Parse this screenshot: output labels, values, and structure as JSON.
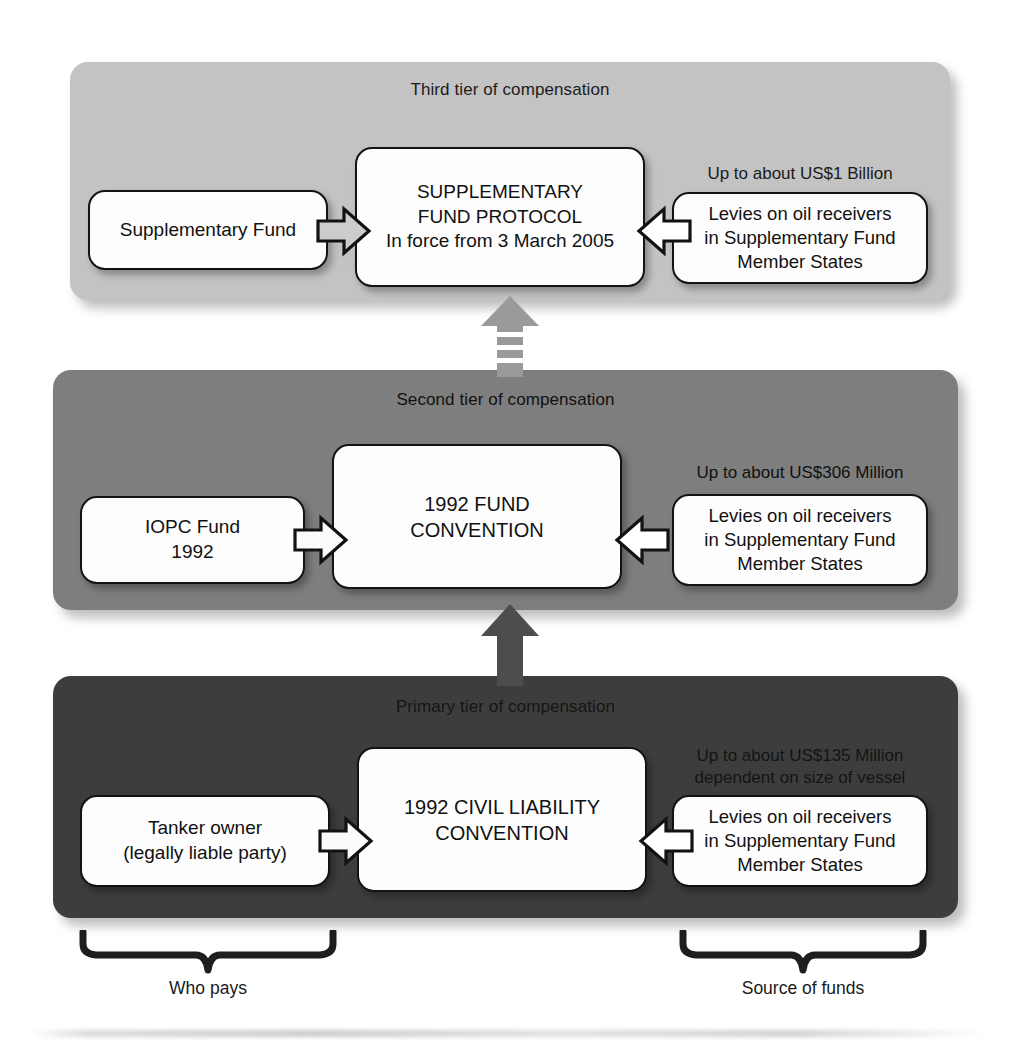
{
  "diagram": {
    "tiers": [
      {
        "id": "third",
        "title": "Third tier of compensation",
        "left_box": {
          "lines": [
            "Supplementary Fund"
          ]
        },
        "center_box": {
          "lines": [
            "SUPPLEMENTARY",
            "FUND PROTOCOL",
            "In force from 3 March 2005"
          ]
        },
        "caption": {
          "lines": [
            "Up to about US$1 Billion"
          ]
        },
        "right_box": {
          "lines": [
            "Levies on oil receivers",
            "in Supplementary Fund",
            "Member States"
          ]
        },
        "panel_color": "#c3c3c3"
      },
      {
        "id": "second",
        "title": "Second tier of compensation",
        "left_box": {
          "lines": [
            "IOPC Fund",
            "1992"
          ]
        },
        "center_box": {
          "lines": [
            "1992 FUND",
            "CONVENTION"
          ]
        },
        "caption": {
          "lines": [
            "Up to about US$306 Million"
          ]
        },
        "right_box": {
          "lines": [
            "Levies on oil receivers",
            "in Supplementary Fund",
            "Member States"
          ]
        },
        "panel_color": "#7e7e7e"
      },
      {
        "id": "primary",
        "title": "Primary tier of compensation",
        "left_box": {
          "lines": [
            "Tanker owner",
            "(legally liable party)"
          ]
        },
        "center_box": {
          "lines": [
            "1992 CIVIL LIABILITY",
            "CONVENTION"
          ]
        },
        "caption": {
          "lines": [
            "Up to about US$135 Million",
            "dependent on size of vessel"
          ]
        },
        "right_box": {
          "lines": [
            "Levies on oil receivers",
            "in Supplementary Fund",
            "Member States"
          ]
        },
        "panel_color": "#3d3d3d"
      }
    ],
    "connectors": [
      {
        "name": "tier2-to-tier3",
        "style": "segmented-up-arrow",
        "color": "#8f8f8f"
      },
      {
        "name": "tier1-to-tier2",
        "style": "solid-up-arrow",
        "color": "#4a4a4a"
      }
    ],
    "flow_arrows": [
      {
        "name": "left-to-center",
        "direction": "right"
      },
      {
        "name": "right-to-center",
        "direction": "left"
      }
    ],
    "braces": [
      {
        "name": "who-pays",
        "label": "Who pays"
      },
      {
        "name": "source-of-funds",
        "label": "Source of funds"
      }
    ]
  }
}
